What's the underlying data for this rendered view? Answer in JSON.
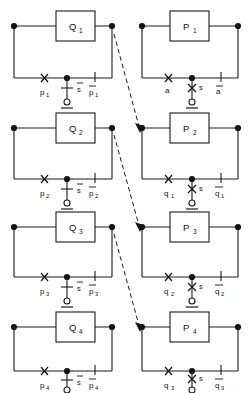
{
  "diagram": {
    "background_color": "#ffffff",
    "line_color": "#1a1a1a",
    "columns": [
      {
        "name": "left-column",
        "id": "Q"
      },
      {
        "name": "right-column",
        "id": "P"
      }
    ],
    "cells": [
      {
        "id": "q1",
        "box_label": "Q",
        "box_sub": "1",
        "left_label": "p",
        "left_sub": "1",
        "left_symbol": "x-switch-mark",
        "center_label": "s",
        "center_sub": "",
        "center_overbar": true,
        "center_symbol": "contact-bar",
        "right_label": "p",
        "right_sub": "1",
        "right_overbar": true,
        "right_symbol": "tick-mark",
        "ground_symbol": "open-terminal-ground"
      },
      {
        "id": "p1",
        "box_label": "P",
        "box_sub": "1",
        "left_label": "a",
        "left_sub": "",
        "left_symbol": "x-switch-mark",
        "center_label": "s",
        "center_sub": "",
        "center_overbar": false,
        "center_symbol": "x-contact",
        "right_label": "a",
        "right_sub": "",
        "right_overbar": true,
        "right_symbol": "tick-mark",
        "ground_symbol": "open-terminal-ground"
      },
      {
        "id": "q2",
        "box_label": "Q",
        "box_sub": "2",
        "left_label": "p",
        "left_sub": "2",
        "left_symbol": "x-switch-mark",
        "center_label": "s",
        "center_sub": "",
        "center_overbar": true,
        "center_symbol": "contact-bar",
        "right_label": "p",
        "right_sub": "2",
        "right_overbar": true,
        "right_symbol": "tick-mark",
        "ground_symbol": "open-terminal-ground"
      },
      {
        "id": "p2",
        "box_label": "P",
        "box_sub": "2",
        "left_label": "q",
        "left_sub": "1",
        "left_symbol": "x-switch-mark",
        "center_label": "s",
        "center_sub": "",
        "center_overbar": false,
        "center_symbol": "x-contact",
        "right_label": "q",
        "right_sub": "1",
        "right_overbar": true,
        "right_symbol": "tick-mark",
        "ground_symbol": "open-terminal-ground"
      },
      {
        "id": "q3",
        "box_label": "Q",
        "box_sub": "3",
        "left_label": "p",
        "left_sub": "3",
        "left_symbol": "x-switch-mark",
        "center_label": "s",
        "center_sub": "",
        "center_overbar": true,
        "center_symbol": "contact-bar",
        "right_label": "p",
        "right_sub": "3",
        "right_overbar": true,
        "right_symbol": "tick-mark",
        "ground_symbol": "open-terminal-ground"
      },
      {
        "id": "p3",
        "box_label": "P",
        "box_sub": "3",
        "left_label": "q",
        "left_sub": "2",
        "left_symbol": "x-switch-mark",
        "center_label": "s",
        "center_sub": "",
        "center_overbar": false,
        "center_symbol": "x-contact",
        "right_label": "q",
        "right_sub": "2",
        "right_overbar": true,
        "right_symbol": "tick-mark",
        "ground_symbol": "open-terminal-ground"
      },
      {
        "id": "q4",
        "box_label": "Q",
        "box_sub": "4",
        "left_label": "p",
        "left_sub": "4",
        "left_symbol": "x-switch-mark",
        "center_label": "s",
        "center_sub": "",
        "center_overbar": true,
        "center_symbol": "contact-bar",
        "right_label": "p",
        "right_sub": "4",
        "right_overbar": true,
        "right_symbol": "tick-mark",
        "ground_symbol": "open-terminal-ground"
      },
      {
        "id": "p4",
        "box_label": "P",
        "box_sub": "4",
        "left_label": "q",
        "left_sub": "3",
        "left_symbol": "x-switch-mark",
        "center_label": "s",
        "center_sub": "",
        "center_overbar": false,
        "center_symbol": "x-contact",
        "right_label": "q",
        "right_sub": "3",
        "right_overbar": true,
        "right_symbol": "tick-mark",
        "ground_symbol": "open-terminal-ground"
      }
    ],
    "connectors": [
      {
        "name": "q1-to-p2",
        "from": "q1",
        "to": "p2",
        "style": "dashed",
        "arrow": true
      },
      {
        "name": "q2-to-p3",
        "from": "q2",
        "to": "p3",
        "style": "dashed",
        "arrow": true
      },
      {
        "name": "q3-to-p4",
        "from": "q3",
        "to": "p4",
        "style": "dashed",
        "arrow": true
      }
    ]
  }
}
